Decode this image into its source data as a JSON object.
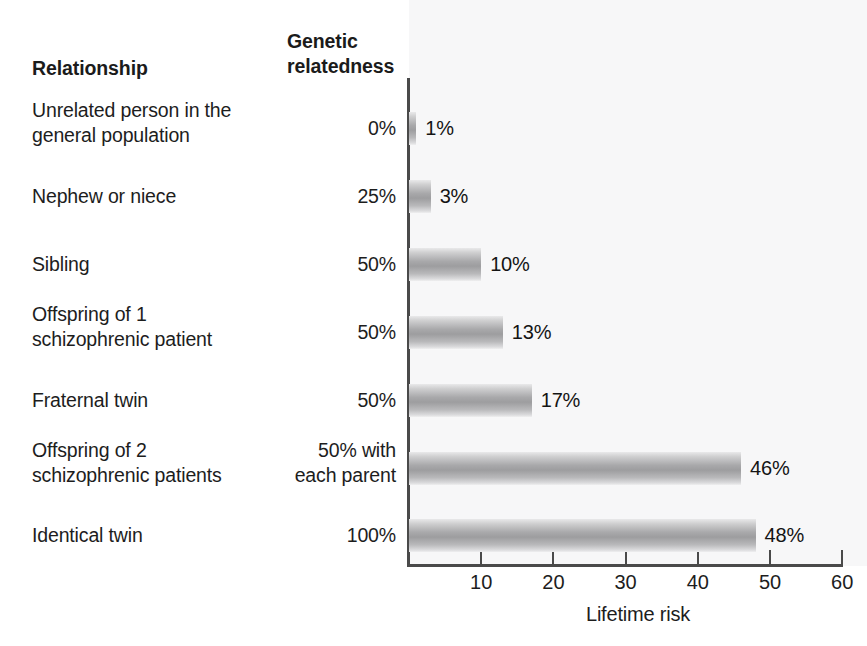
{
  "headers": {
    "relationship": "Relationship",
    "relatedness_line1": "Genetic",
    "relatedness_line2": "relatedness"
  },
  "axis": {
    "title": "Lifetime risk",
    "ticks": [
      "10",
      "20",
      "30",
      "40",
      "50",
      "60"
    ]
  },
  "chart_data": {
    "type": "bar",
    "orientation": "horizontal",
    "title": "",
    "xlabel": "Lifetime risk",
    "ylabel": "",
    "xlim": [
      0,
      60
    ],
    "tick_values": [
      10,
      20,
      30,
      40,
      50,
      60
    ],
    "grid": false,
    "legend": false,
    "categories": [
      "Unrelated person in the general population",
      "Nephew or niece",
      "Sibling",
      "Offspring of 1 schizophrenic patient",
      "Fraternal twin",
      "Offspring of 2 schizophrenic patients",
      "Identical twin"
    ],
    "values": [
      1,
      3,
      10,
      13,
      17,
      46,
      48
    ],
    "value_labels": [
      "1%",
      "3%",
      "10%",
      "13%",
      "17%",
      "46%",
      "48%"
    ],
    "genetic_relatedness": [
      "0%",
      "25%",
      "50%",
      "50%",
      "50%",
      "50% with each parent",
      "100%"
    ],
    "bar_color": "#a9a9ab"
  },
  "rows": [
    {
      "label_line1": "Unrelated person in the",
      "label_line2": "general population",
      "relatedness_line1": "0%",
      "relatedness_line2": "",
      "value_label": "1%"
    },
    {
      "label_line1": "Nephew or niece",
      "label_line2": "",
      "relatedness_line1": "25%",
      "relatedness_line2": "",
      "value_label": "3%"
    },
    {
      "label_line1": "Sibling",
      "label_line2": "",
      "relatedness_line1": "50%",
      "relatedness_line2": "",
      "value_label": "10%"
    },
    {
      "label_line1": "Offspring of 1",
      "label_line2": "schizophrenic patient",
      "relatedness_line1": "50%",
      "relatedness_line2": "",
      "value_label": "13%"
    },
    {
      "label_line1": "Fraternal twin",
      "label_line2": "",
      "relatedness_line1": "50%",
      "relatedness_line2": "",
      "value_label": "17%"
    },
    {
      "label_line1": "Offspring of 2",
      "label_line2": "schizophrenic patients",
      "relatedness_line1": "50% with",
      "relatedness_line2": "each parent",
      "value_label": "46%"
    },
    {
      "label_line1": "Identical twin",
      "label_line2": "",
      "relatedness_line1": "100%",
      "relatedness_line2": "",
      "value_label": "48%"
    }
  ]
}
